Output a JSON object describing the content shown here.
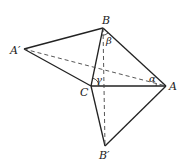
{
  "diagram": {
    "points": {
      "A": {
        "label": "A",
        "x": 166,
        "y": 86
      },
      "B": {
        "label": "B",
        "x": 103,
        "y": 28
      },
      "C": {
        "label": "C",
        "x": 91,
        "y": 86
      },
      "A_prime": {
        "label": "A′",
        "x": 24,
        "y": 49
      },
      "B_prime": {
        "label": "B′",
        "x": 105,
        "y": 146
      }
    },
    "angles": {
      "alpha": {
        "label": "α"
      },
      "beta": {
        "label": "β"
      },
      "gamma": {
        "label": "γ"
      }
    },
    "segments_solid": [
      "A′B",
      "A′C",
      "BC",
      "BA",
      "CA",
      "CB′",
      "AB′"
    ],
    "segments_dashed": [
      "A′A",
      "BB′"
    ],
    "stroke_color": "#222222"
  }
}
